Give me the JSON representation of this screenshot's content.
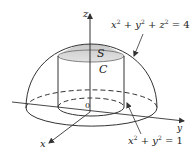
{
  "figure": {
    "labels": {
      "z_axis": "z",
      "y_axis": "y",
      "x_axis": "x",
      "origin": "0",
      "surface": "S",
      "curve": "C"
    },
    "sphere_equation": {
      "x": "x",
      "x_exp": "2",
      "y": "y",
      "y_exp": "2",
      "z": "z",
      "z_exp": "2",
      "plus": "+",
      "equals": "=",
      "rhs": "4"
    },
    "cylinder_equation": {
      "x": "x",
      "x_exp": "2",
      "y": "y",
      "y_exp": "2",
      "plus": "+",
      "equals": "=",
      "rhs": "1"
    },
    "colors": {
      "stroke": "#333333",
      "cap_fill": "#d4d4d4",
      "background": "#ffffff"
    }
  }
}
